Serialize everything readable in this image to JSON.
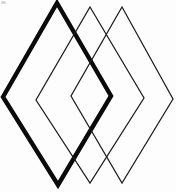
{
  "figure": {
    "background": "#fdfdfd",
    "canvas": {
      "width": 176,
      "height": 192
    },
    "stroke_colors": {
      "thick": "#0a0a0a",
      "thin": "#1d1d1d"
    },
    "diamonds": [
      {
        "name": "diamond-thick-left",
        "style": "thick",
        "stroke_width": 4.4,
        "vertices": {
          "top": [
            57,
            3
          ],
          "right": [
            111,
            96
          ],
          "bottom": [
            58,
            185
          ],
          "left": [
            3,
            97
          ]
        }
      },
      {
        "name": "diamond-thin-middle",
        "style": "thin",
        "stroke_width": 1.25,
        "vertices": {
          "top": [
            90,
            7
          ],
          "right": [
            144,
            98
          ],
          "bottom": [
            90,
            183
          ],
          "left": [
            36,
            100
          ]
        }
      },
      {
        "name": "diamond-thin-right",
        "style": "thin",
        "stroke_width": 1.25,
        "vertices": {
          "top": [
            122,
            7
          ],
          "right": [
            173,
            99
          ],
          "bottom": [
            122,
            183
          ],
          "left": [
            71,
            96
          ]
        }
      }
    ],
    "artifacts": [
      {
        "name": "corner-smudge",
        "x": 1,
        "y": 1,
        "width": 5,
        "height": 3,
        "color": "#b8b8b8",
        "opacity": 0.55
      }
    ]
  }
}
